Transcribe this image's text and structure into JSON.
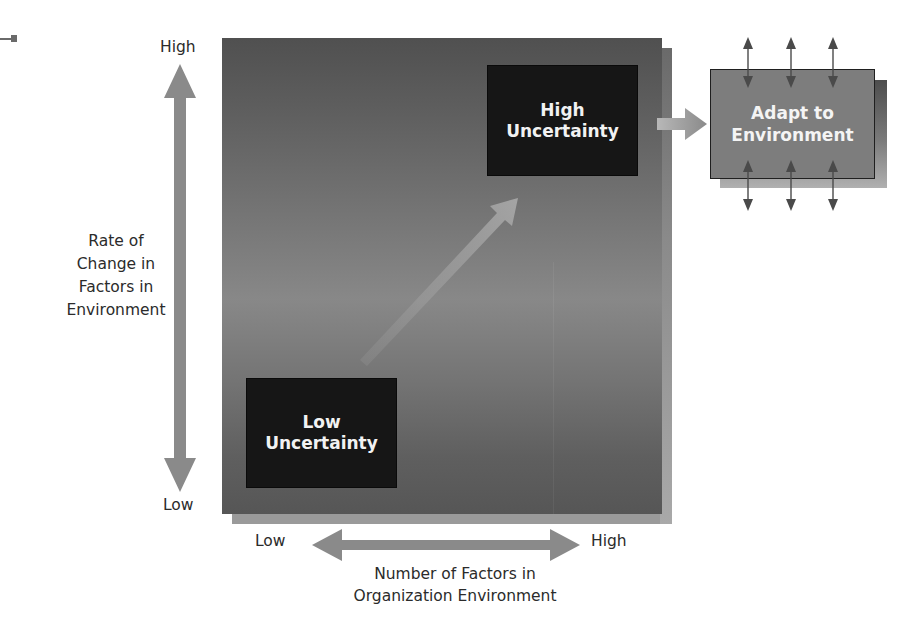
{
  "diagram": {
    "type": "environmental-uncertainty-framework",
    "vertical_axis": {
      "title_lines": [
        "Rate of",
        "Change in",
        "Factors in",
        "Environment"
      ],
      "high_label": "High",
      "low_label": "Low"
    },
    "horizontal_axis": {
      "title_lines": [
        "Number of Factors in",
        "Organization Environment"
      ],
      "low_label": "Low",
      "high_label": "High"
    },
    "boxes": {
      "high_uncertainty": {
        "lines": [
          "High",
          "Uncertainty"
        ]
      },
      "low_uncertainty": {
        "lines": [
          "Low",
          "Uncertainty"
        ]
      },
      "adapt": {
        "lines": [
          "Adapt to",
          "Environment"
        ]
      }
    },
    "colors": {
      "square_dark": "#505050",
      "square_mid": "#888888",
      "box_fill": "#161616",
      "adapt_fill": "#7d7d7d",
      "arrow_gray": "#8a8a8a",
      "text_light": "#f2f2f2",
      "text_dark": "#2b2b2b"
    }
  }
}
